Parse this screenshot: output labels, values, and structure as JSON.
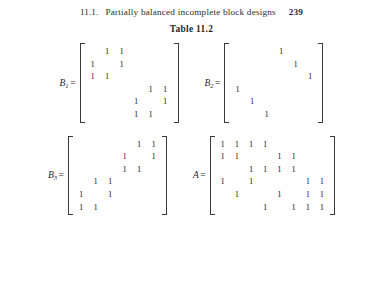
{
  "running_head": {
    "section_number": "11.1.",
    "title": "Partially balanced incomplete block designs",
    "page_number": "239"
  },
  "caption": "Table 11.2",
  "symbols": {
    "one": "1",
    "equals": "=",
    "blank": ""
  },
  "matrices": [
    {
      "name": "B1",
      "label_base": "B",
      "label_sub": "1",
      "rows": 6,
      "cols": 6,
      "values": [
        [
          0,
          1,
          1,
          0,
          0,
          0
        ],
        [
          1,
          0,
          1,
          0,
          0,
          0
        ],
        [
          1,
          1,
          0,
          0,
          0,
          0
        ],
        [
          0,
          0,
          0,
          0,
          1,
          1
        ],
        [
          0,
          0,
          0,
          1,
          0,
          1
        ],
        [
          0,
          0,
          0,
          1,
          1,
          0
        ]
      ]
    },
    {
      "name": "B2",
      "label_base": "B",
      "label_sub": "2",
      "rows": 6,
      "cols": 6,
      "values": [
        [
          0,
          0,
          0,
          1,
          0,
          0
        ],
        [
          0,
          0,
          0,
          0,
          1,
          0
        ],
        [
          0,
          0,
          0,
          0,
          0,
          1
        ],
        [
          1,
          0,
          0,
          0,
          0,
          0
        ],
        [
          0,
          1,
          0,
          0,
          0,
          0
        ],
        [
          0,
          0,
          1,
          0,
          0,
          0
        ]
      ]
    },
    {
      "name": "B3",
      "label_base": "B",
      "label_sub": "3",
      "rows": 6,
      "cols": 6,
      "values": [
        [
          0,
          0,
          0,
          0,
          1,
          1
        ],
        [
          0,
          0,
          0,
          1,
          0,
          1
        ],
        [
          0,
          0,
          0,
          1,
          1,
          0
        ],
        [
          0,
          1,
          1,
          0,
          0,
          0
        ],
        [
          1,
          0,
          1,
          0,
          0,
          0
        ],
        [
          1,
          1,
          0,
          0,
          0,
          0
        ]
      ]
    },
    {
      "name": "A",
      "label_base": "A",
      "label_sub": "",
      "rows": 6,
      "cols": 8,
      "values": [
        [
          1,
          1,
          1,
          1,
          0,
          0,
          0,
          0
        ],
        [
          1,
          1,
          0,
          0,
          1,
          1,
          0,
          0
        ],
        [
          0,
          0,
          1,
          1,
          1,
          1,
          0,
          0
        ],
        [
          1,
          0,
          1,
          0,
          0,
          0,
          1,
          1
        ],
        [
          0,
          1,
          0,
          0,
          1,
          0,
          1,
          1
        ],
        [
          0,
          0,
          0,
          1,
          0,
          1,
          1,
          1
        ]
      ]
    }
  ]
}
